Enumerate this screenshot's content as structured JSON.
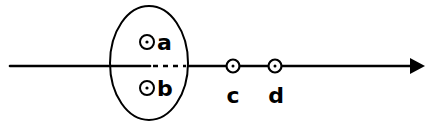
{
  "diagram": {
    "axis": {
      "has_arrow": true,
      "direction": "right"
    },
    "region": {
      "shape": "ellipse",
      "boundary_crossing": "dashed inside"
    },
    "points": [
      {
        "id": "a",
        "label": "a",
        "marker": "circled-dot",
        "position": "inside ellipse, above line"
      },
      {
        "id": "b",
        "label": "b",
        "marker": "circled-dot",
        "position": "inside ellipse, below line"
      },
      {
        "id": "c",
        "label": "c",
        "marker": "circled-dot",
        "position": "on line, outside ellipse"
      },
      {
        "id": "d",
        "label": "d",
        "marker": "circled-dot",
        "position": "on line, outside ellipse"
      }
    ],
    "colors": {
      "stroke": "#000000",
      "background": "#ffffff"
    }
  }
}
